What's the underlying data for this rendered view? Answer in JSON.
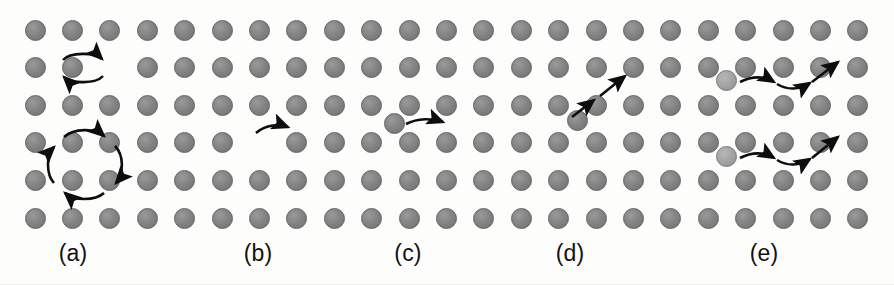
{
  "figure": {
    "background_color": "#fdfdfc",
    "width": 894,
    "height": 285
  },
  "lattice": {
    "description": "Regular square array of gray atoms forming the crystal matrix",
    "columns": 23,
    "rows": 6,
    "origin_x": 35,
    "origin_y": 30,
    "spacing_x": 37.4,
    "spacing_y": 37.6,
    "atom_diameter": 21,
    "atom_color": "#848484",
    "atom_edge_color": "#5f5f5f",
    "defect_atom_color": "#a4a4a4",
    "defect_atom_edge_color": "#777777",
    "missing": [
      {
        "row": 1,
        "col": 2,
        "panel": "a"
      },
      {
        "row": 3,
        "col": 6,
        "panel": "b"
      }
    ]
  },
  "panels": [
    {
      "id": "a",
      "label": "(a)",
      "label_x": 73,
      "label_y": 240,
      "mechanism": "Direct exchange and ring exchange",
      "arrow_count": 6
    },
    {
      "id": "b",
      "label": "(b)",
      "label_x": 258,
      "label_y": 240,
      "mechanism": "Vacancy mechanism",
      "arrow_count": 1
    },
    {
      "id": "c",
      "label": "(c)",
      "label_x": 408,
      "label_y": 240,
      "mechanism": "Interstitial mechanism",
      "arrow_count": 1
    },
    {
      "id": "d",
      "label": "(d)",
      "label_x": 570,
      "label_y": 240,
      "mechanism": "Interstitialcy mechanism",
      "arrow_count": 2
    },
    {
      "id": "e",
      "label": "(e)",
      "label_x": 764,
      "label_y": 240,
      "mechanism": "Crowdion chain migration",
      "arrow_count": 6
    }
  ],
  "defect_atoms": [
    {
      "panel": "c",
      "x": 394,
      "y": 123,
      "type": "interstitial"
    },
    {
      "panel": "d",
      "x": 577,
      "y": 120,
      "type": "interstitial"
    },
    {
      "panel": "e",
      "x": 726,
      "y": 80,
      "type": "crowdion",
      "light": true
    },
    {
      "panel": "e",
      "x": 726,
      "y": 156,
      "type": "crowdion",
      "light": true
    }
  ],
  "arrows": {
    "stroke_color": "#0d0d0d",
    "stroke_width": 2.6,
    "head_color": "#0d0d0d"
  }
}
